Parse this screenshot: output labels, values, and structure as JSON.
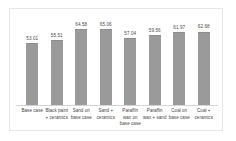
{
  "chart_data": {
    "type": "bar",
    "title": "",
    "subtitle": "",
    "xlabel": "",
    "ylabel": "",
    "categories": [
      "Base case",
      "Black paint + ceramics",
      "Sand on base case",
      "Sand + ceramics",
      "Paraffin wax on base case",
      "Paraffin wax + sand",
      "Coal on base case",
      "Coal + ceramics"
    ],
    "values": [
      53.01,
      55.51,
      64.58,
      65.06,
      57.04,
      59.56,
      61.97,
      62.68
    ],
    "data_labels": [
      "53.01",
      "55.51",
      "64.58",
      "65.06",
      "57.04",
      "59.56",
      "61.97",
      "62.68"
    ],
    "ylim": [
      0,
      70
    ],
    "grid": false,
    "legend": false,
    "legend_position": "none",
    "axis_ticks_visible": false,
    "bar_color": "#9a9a9a",
    "label_color": "#4a4a4a",
    "background_color": "#ffffff",
    "border_color": "#e8e8e8"
  }
}
